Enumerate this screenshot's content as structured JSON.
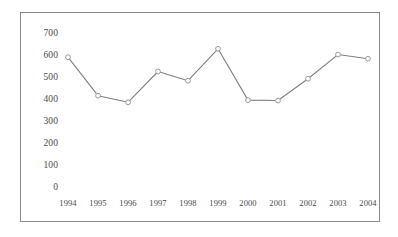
{
  "chart_data": {
    "type": "line",
    "title": "",
    "subtitle": "",
    "xlabel": "",
    "ylabel": "",
    "categories": [
      "1994",
      "1995",
      "1996",
      "1997",
      "1998",
      "1999",
      "2000",
      "2001",
      "2002",
      "2003",
      "2004"
    ],
    "values": [
      590,
      415,
      385,
      525,
      483,
      628,
      395,
      393,
      492,
      602,
      583
    ],
    "series": [
      {
        "name": "series-1",
        "values": [
          590,
          415,
          385,
          525,
          483,
          628,
          395,
          393,
          492,
          602,
          583
        ]
      }
    ],
    "ylim": [
      0,
      700
    ],
    "ytick_labels": [
      "700",
      "600",
      "500",
      "400",
      "300",
      "200",
      "100",
      "0"
    ],
    "ytick_values": [
      700,
      600,
      500,
      400,
      300,
      200,
      100,
      0
    ],
    "xtick_labels": [
      "1994",
      "1995",
      "1996",
      "1997",
      "1998",
      "1999",
      "2000",
      "2001",
      "2002",
      "2003",
      "2004"
    ],
    "grid": false,
    "legend": "none",
    "marker": "circle-open",
    "colors": {
      "line": "#7f7f7f",
      "marker_stroke": "#9a9a9a",
      "marker_fill": "#ffffff",
      "axis_text": "#4a4a4a",
      "frame_border": "#8a8a8a",
      "background": "#ffffff"
    }
  }
}
